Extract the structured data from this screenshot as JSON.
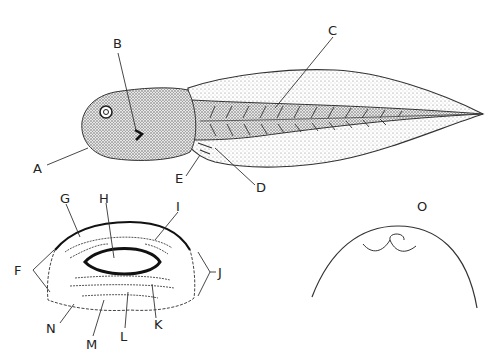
{
  "figure": {
    "labels": {
      "A": "A",
      "B": "B",
      "C": "C",
      "D": "D",
      "E": "E",
      "F": "F",
      "G": "G",
      "H": "H",
      "I": "I",
      "J": "J",
      "K": "K",
      "L": "L",
      "M": "M",
      "N": "N",
      "O": "O"
    },
    "panels": [
      {
        "name": "tadpole-lateral",
        "labels": [
          "A",
          "B",
          "C",
          "D",
          "E"
        ]
      },
      {
        "name": "oral-disc",
        "labels": [
          "F",
          "G",
          "H",
          "I",
          "J",
          "K",
          "L",
          "M",
          "N"
        ]
      },
      {
        "name": "head-outline",
        "labels": [
          "O"
        ]
      }
    ],
    "colors": {
      "ink": "#222222",
      "background": "#ffffff",
      "stipple": "#9a9a9a"
    }
  }
}
